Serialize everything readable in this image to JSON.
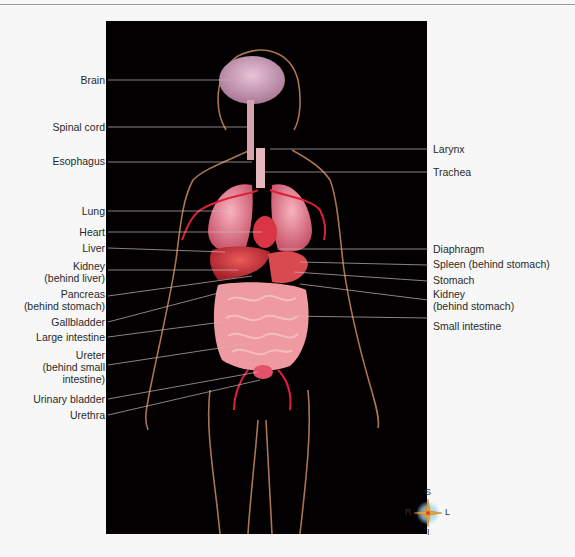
{
  "figure": {
    "background_color": "#020000",
    "organ_color": "#e8788a",
    "vessel_color": "#e0203a",
    "leader_color": "#c9b8b8"
  },
  "labels_left": [
    {
      "id": "brain",
      "text": "Brain",
      "y": 79
    },
    {
      "id": "spinal-cord",
      "text": "Spinal cord",
      "y": 126
    },
    {
      "id": "esophagus",
      "text": "Esophagus",
      "y": 161
    },
    {
      "id": "lung",
      "text": "Lung",
      "y": 210
    },
    {
      "id": "heart",
      "text": "Heart",
      "y": 231
    },
    {
      "id": "liver",
      "text": "Liver",
      "y": 247
    },
    {
      "id": "kidney-left",
      "text": "Kidney",
      "line2": "(behind liver)",
      "y": 264
    },
    {
      "id": "pancreas",
      "text": "Pancreas",
      "line2": "(behind stomach)",
      "y": 292
    },
    {
      "id": "gallbladder",
      "text": "Gallbladder",
      "y": 321
    },
    {
      "id": "large-intestine",
      "text": "Large intestine",
      "y": 336
    },
    {
      "id": "ureter",
      "text": "Ureter",
      "line2": "(behind small",
      "line3": "intestine)",
      "y": 354
    },
    {
      "id": "urinary-bladder",
      "text": "Urinary bladder",
      "y": 398
    },
    {
      "id": "urethra",
      "text": "Urethra",
      "y": 414
    }
  ],
  "labels_right": [
    {
      "id": "larynx",
      "text": "Larynx",
      "y": 148
    },
    {
      "id": "trachea",
      "text": "Trachea",
      "y": 171
    },
    {
      "id": "diaphragm",
      "text": "Diaphragm",
      "y": 248
    },
    {
      "id": "spleen",
      "text": "Spleen (behind stomach)",
      "y": 264
    },
    {
      "id": "stomach",
      "text": "Stomach",
      "y": 280
    },
    {
      "id": "kidney-right",
      "text": "Kidney",
      "line2": "(behind stomach)",
      "y": 294
    },
    {
      "id": "small-intestine",
      "text": "Small intestine",
      "y": 326
    }
  ],
  "compass": {
    "superior": "S",
    "inferior": "I",
    "right": "R",
    "left": "L"
  }
}
